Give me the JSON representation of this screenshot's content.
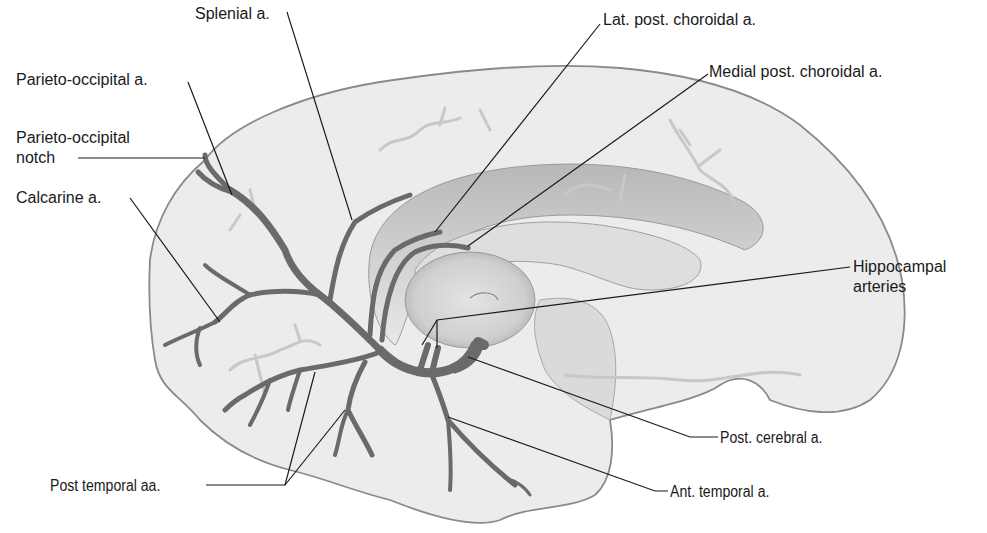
{
  "figure": {
    "colors": {
      "background": "#ffffff",
      "brain_fill": "#ececec",
      "brain_outline": "#8a8a8a",
      "artery": "#6a6a6a",
      "leader_line": "#1a1a1a",
      "label_text": "#1a1a1a"
    }
  },
  "labels": {
    "splenial": "Splenial a.",
    "lat_post_choroidal": "Lat. post. choroidal a.",
    "medial_post_choroidal": "Medial post. choroidal a.",
    "parieto_occipital_a": "Parieto-occipital a.",
    "parieto_occipital_notch_line1": "Parieto-occipital",
    "parieto_occipital_notch_line2": "notch",
    "calcarine": "Calcarine a.",
    "hippocampal_line1": "Hippocampal",
    "hippocampal_line2": "arteries",
    "post_cerebral": "Post. cerebral a.",
    "post_temporal": "Post temporal aa.",
    "ant_temporal": "Ant. temporal a."
  }
}
